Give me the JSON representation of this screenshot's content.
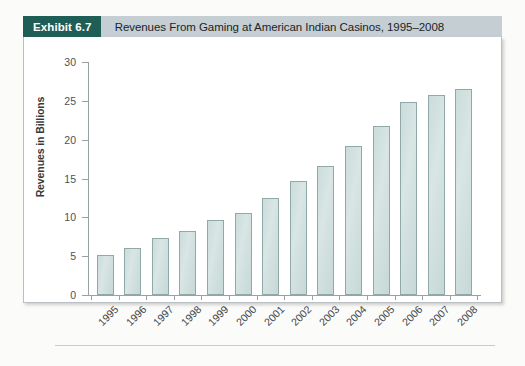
{
  "exhibit": {
    "badge_label": "Exhibit 6.7",
    "title": "Revenues From Gaming at American Indian Casinos, 1995–2008"
  },
  "colors": {
    "badge_bg": "#1f5e56",
    "header_bg": "#c5ced2",
    "bar_fill": "#d2e1df",
    "bar_border": "#90a9a8",
    "axis": "#9aa1a4",
    "text": "#3f4749"
  },
  "chart_data": {
    "type": "bar",
    "title": "Revenues From Gaming at American Indian Casinos, 1995–2008",
    "xlabel": "",
    "ylabel": "Revenues in Billions",
    "categories": [
      "1995",
      "1996",
      "1997",
      "1998",
      "1999",
      "2000",
      "2001",
      "2002",
      "2003",
      "2004",
      "2005",
      "2006",
      "2007",
      "2008"
    ],
    "values": [
      5.2,
      6.0,
      7.3,
      8.2,
      9.7,
      10.6,
      12.5,
      14.7,
      16.6,
      19.2,
      21.8,
      24.8,
      25.8,
      26.5
    ],
    "ylim": [
      0,
      30
    ],
    "yticks": [
      0,
      5,
      10,
      15,
      20,
      25,
      30
    ],
    "ytick_labels": [
      "0",
      "5",
      "10",
      "15",
      "20",
      "25",
      "30"
    ],
    "grid": false,
    "legend": null
  }
}
